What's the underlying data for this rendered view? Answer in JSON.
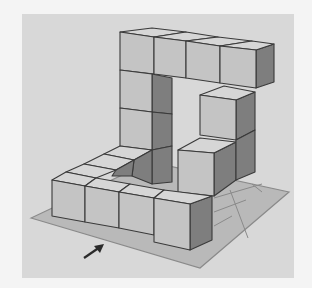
{
  "figure": {
    "colors": {
      "page": "#f4f4f4",
      "panel": "#d8d8d8",
      "plate": "#b9b9b9",
      "plate_edge": "#8a8a8a",
      "top": "#d6d6d6",
      "front": "#c4c4c4",
      "side": "#7e7e7e",
      "edge": "#3a3a3a",
      "arrow": "#2a2a2a"
    },
    "arrow": {
      "label": "view-direction-arrow",
      "x1": 84,
      "y1": 258,
      "x2": 104,
      "y2": 244
    }
  },
  "panel": {
    "x": 22,
    "y": 14,
    "w": 272,
    "h": 264
  },
  "plate": {
    "points": "31,218 200,268 289,192 150,162"
  },
  "plate_grid": [
    "214,198 262,184",
    "214,212 246,200",
    "214,226 232,216",
    "230,190 248,238",
    "252,184 262,192"
  ],
  "cubes": [
    {
      "name": "top-row-cube-1",
      "top": "120,32 152,28 186,32 154,37",
      "front": "120,32 154,37 154,74 120,70",
      "side": null
    },
    {
      "name": "top-row-cube-2",
      "top": "154,37 186,32 218,37 186,41",
      "front": "154,37 186,41 186,78 154,74",
      "side": null
    },
    {
      "name": "top-row-cube-3",
      "top": "186,41 218,37 252,41 220,46",
      "front": "186,41 220,46 220,83 186,78",
      "side": null
    },
    {
      "name": "top-row-cube-4",
      "top": "220,46 252,41 274,44 256,50",
      "front": "220,46 256,50 256,88 220,83",
      "side": "256,50 274,44 274,82 256,88"
    },
    {
      "name": "left-pillar-cube-1",
      "top": null,
      "front": "120,70 152,74 152,112 120,108",
      "side": "152,74 172,78 172,114 152,112"
    },
    {
      "name": "left-pillar-cube-2",
      "top": null,
      "front": "120,108 152,112 152,150 120,146",
      "side": "152,112 172,114 172,146 152,150"
    },
    {
      "name": "right-pillar-cube-1",
      "top": "200,95 224,86 255,92 236,100",
      "front": "200,95 236,100 236,140 200,135",
      "side": "236,100 255,92 255,130 236,140"
    },
    {
      "name": "right-pillar-cube-2",
      "top": "178,150 200,138 236,142 214,153",
      "front": "178,150 214,153 214,196 178,192",
      "side": "214,153 236,142 236,180 214,196"
    },
    {
      "name": "right-pillar-cube-3",
      "top": null,
      "front": null,
      "side": "236,140 255,130 255,172 236,180"
    },
    {
      "name": "floor-back-cube-1",
      "top": "120,146 152,150 134,160 104,154",
      "front": null,
      "side": "152,150 172,146 172,182 152,184"
    },
    {
      "name": "floor-back-cube-2",
      "top": "104,154 134,160 116,170 84,164",
      "front": null,
      "side": "134,160 152,150 152,184 132,176"
    },
    {
      "name": "floor-back-cube-3",
      "top": "84,164 116,170 96,178 66,172",
      "front": null,
      "side": "116,170 134,160 132,176 112,176"
    },
    {
      "name": "front-row-cube-1",
      "top": "52,180 66,172 96,178 85,186",
      "front": "52,180 85,186 85,222 52,216",
      "side": null
    },
    {
      "name": "front-row-cube-2",
      "top": "85,186 96,178 130,184 119,192",
      "front": "85,186 119,192 119,228 85,222",
      "side": null
    },
    {
      "name": "front-row-cube-3",
      "top": "119,192 130,184 164,190 154,198",
      "front": "119,192 154,198 154,235 119,228",
      "side": null
    },
    {
      "name": "front-row-cube-4",
      "top": "154,198 164,190 212,196 190,204",
      "front": "154,198 190,204 190,250 154,242",
      "side": "190,204 212,196 212,240 190,250"
    }
  ]
}
